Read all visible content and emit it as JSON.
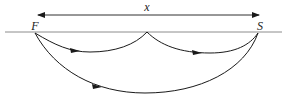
{
  "diagram": {
    "labels": {
      "distance": "x",
      "source": "F",
      "receiver": "S"
    },
    "colors": {
      "stroke": "#1a1a1a",
      "surface": "#8c8c8c",
      "background": "#ffffff"
    },
    "elements": [
      {
        "type": "double-arrow",
        "label": "x",
        "from": [
          36,
          15
        ],
        "to": [
          260,
          15
        ]
      },
      {
        "type": "surface-line",
        "from": [
          5,
          32
        ],
        "to": [
          282,
          32
        ]
      },
      {
        "type": "ray-path",
        "name": "first-bounce-leg",
        "from": "F",
        "to": "midpoint",
        "direction": "F→mid"
      },
      {
        "type": "ray-path",
        "name": "second-bounce-leg",
        "from": "midpoint",
        "to": "S",
        "direction": "mid→S"
      },
      {
        "type": "ray-path",
        "name": "direct-deep-path",
        "from": "F",
        "to": "S",
        "direction": "F→S"
      }
    ]
  }
}
